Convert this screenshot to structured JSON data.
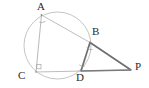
{
  "figure": {
    "background_color": "#ffffff",
    "stroke_light": "#b9b9b9",
    "stroke_mid": "#8f8f8f",
    "stroke_dark": "#6e6e6e",
    "label_color": "#2b2b2b",
    "mark_color": "#9a9a9a"
  },
  "circle": {
    "name": "circumcircle",
    "cx": 57.5,
    "cy": 45.5,
    "r": 33.5,
    "stroke": "#bdbdbd",
    "stroke_width": 0.9,
    "fill": "none"
  },
  "points": [
    {
      "id": "A",
      "label": "A",
      "x": 41.5,
      "y": 15.0,
      "label_x": 37,
      "label_y": 1
    },
    {
      "id": "B",
      "label": "B",
      "x": 90.0,
      "y": 42.5,
      "label_x": 92,
      "label_y": 26
    },
    {
      "id": "C",
      "label": "C",
      "x": 36.0,
      "y": 72.0,
      "label_x": 18,
      "label_y": 70
    },
    {
      "id": "D",
      "label": "D",
      "x": 81.0,
      "y": 71.0,
      "label_x": 77,
      "label_y": 72
    },
    {
      "id": "P",
      "label": "P",
      "x": 131.0,
      "y": 70.0,
      "label_x": 135,
      "label_y": 60
    }
  ],
  "segments": [
    {
      "id": "AB",
      "from": "A",
      "to": "B",
      "stroke": "#b5b5b5",
      "width": 0.9
    },
    {
      "id": "AC",
      "from": "A",
      "to": "C",
      "stroke": "#b0b0b0",
      "width": 0.9
    },
    {
      "id": "CP",
      "from": "C",
      "to": "P",
      "stroke": "#b5b5b5",
      "width": 0.9
    },
    {
      "id": "BD",
      "from": "B",
      "to": "D",
      "stroke": "#6e6e6e",
      "width": 1.6
    },
    {
      "id": "BP",
      "from": "B",
      "to": "P",
      "stroke": "#6e6e6e",
      "width": 1.6
    },
    {
      "id": "DP",
      "from": "D",
      "to": "P",
      "stroke": "#7a7a7a",
      "width": 1.6
    }
  ],
  "angle_marks": [
    {
      "id": "angle-A",
      "type": "arc",
      "vertex": "A",
      "x": 42.5,
      "y": 22.0
    },
    {
      "id": "angle-B",
      "type": "arc",
      "vertex": "B",
      "x": 89.5,
      "y": 48.5
    },
    {
      "id": "angle-C",
      "type": "right-angle",
      "vertex": "C",
      "x": 38.5,
      "y": 66.0
    },
    {
      "id": "angle-D",
      "type": "arc",
      "vertex": "D",
      "x": 82.0,
      "y": 64.5
    }
  ]
}
